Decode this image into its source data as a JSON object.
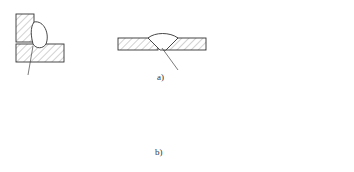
{
  "figure": {
    "subfigures": [
      {
        "label": "a)",
        "description": "Weld joint cross-sections, row a",
        "items": [
          "corner/tee joint with fillet weld",
          "single-V butt weld",
          "double-V butt weld (thick plate)"
        ]
      },
      {
        "label": "b)",
        "description": "Weld joint cross-sections, row b",
        "items": [
          "tee joint with fillet weld",
          "lap joint with two fillet welds",
          "single-V butt weld",
          "double-V butt weld"
        ]
      }
    ]
  },
  "labels": {
    "a": "a)",
    "b": "b)"
  },
  "colors": {
    "line": "#333333",
    "background": "#ffffff"
  }
}
